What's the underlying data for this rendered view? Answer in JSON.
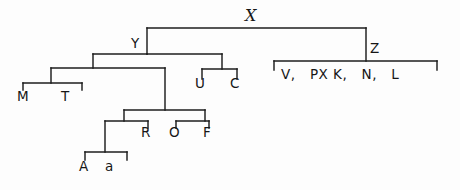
{
  "diagram": {
    "kind": "hierarchical-tree",
    "title_label": "X",
    "nodes": {
      "x": {
        "label": "X",
        "x": 253,
        "y": 20
      },
      "y": {
        "label": "Y",
        "x": 137,
        "y": 44
      },
      "z": {
        "label": "Z",
        "x": 372,
        "y": 51
      },
      "u": {
        "label": "U",
        "x": 200,
        "y": 83
      },
      "c": {
        "label": "C",
        "x": 235,
        "y": 83
      },
      "m": {
        "label": "M",
        "x": 24,
        "y": 101
      },
      "t": {
        "label": "T",
        "x": 67,
        "y": 101
      },
      "r": {
        "label": "R",
        "x": 146,
        "y": 131
      },
      "o": {
        "label": "O",
        "x": 176,
        "y": 131
      },
      "f": {
        "label": "F",
        "x": 206,
        "y": 131
      },
      "a_upper": {
        "label": "A",
        "x": 108,
        "y": 173
      },
      "a_lower": {
        "label": "a",
        "x": 134,
        "y": 173
      }
    },
    "z_leaf_row": {
      "items": [
        "V,",
        "PX",
        "K,",
        "N,",
        "L"
      ],
      "text": "V,   PX K,   N,   L",
      "bracket_left_x": 274,
      "bracket_right_x": 437,
      "bar_y": 61,
      "label_y": 78
    },
    "colors": {
      "ink": "#1d1d1d",
      "paper": "#fdfdfd"
    }
  }
}
